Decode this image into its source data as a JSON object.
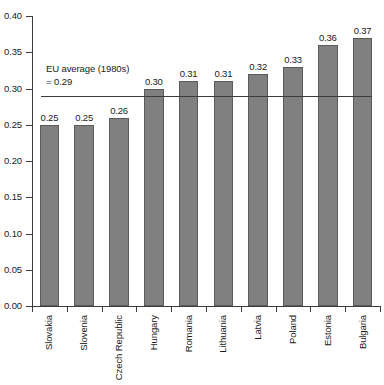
{
  "chart_data": {
    "type": "bar",
    "title": "",
    "subtitle": "",
    "xlabel": "",
    "ylabel": "",
    "ylim": [
      0.0,
      0.4
    ],
    "ytick_step": 0.05,
    "grid": false,
    "legend": null,
    "orientation": "vertical",
    "bar_color": "#808080",
    "bar_outline_color": "#5b5b5b",
    "axis_color": "#3c3c3c",
    "categories": [
      "Slovakia",
      "Slovenia",
      "Czech Republic",
      "Hungary",
      "Romania",
      "Lithuania",
      "Latvia",
      "Poland",
      "Estonia",
      "Bulgaria"
    ],
    "values": [
      0.25,
      0.25,
      0.26,
      0.3,
      0.31,
      0.31,
      0.32,
      0.33,
      0.36,
      0.37
    ],
    "value_labels": [
      "0.25",
      "0.25",
      "0.26",
      "0.30",
      "0.31",
      "0.31",
      "0.32",
      "0.33",
      "0.36",
      "0.37"
    ],
    "ytick_labels": [
      "0.40",
      "0.35",
      "0.30",
      "0.25",
      "0.20",
      "0.15",
      "0.10",
      "0.05",
      "0.00"
    ],
    "ytick_values": [
      0.4,
      0.35,
      0.3,
      0.25,
      0.2,
      0.15,
      0.1,
      0.05,
      0.0
    ],
    "annotations": [
      {
        "name": "eu-average-reference",
        "line_1": "EU average (1980s)",
        "line_2": "= 0.29",
        "value": 0.29,
        "type": "horizontal-reference-line"
      }
    ]
  }
}
